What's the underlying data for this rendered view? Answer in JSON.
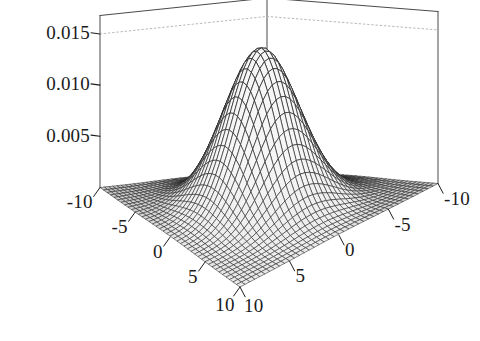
{
  "figure": {
    "kind": "surface-plot-3d",
    "background_color": "#ffffff",
    "line_color": "#1d1d1d",
    "box_color": "#4a4a4a",
    "grid_color": "#b8b8b8",
    "title": "",
    "subtitle": ""
  },
  "axes": {
    "z": {
      "label": "",
      "ticks": [
        "0.015",
        "0.010",
        "0.005"
      ],
      "tick_values": [
        0.015,
        0.01,
        0.005
      ],
      "range": [
        0,
        0.0168
      ]
    },
    "x": {
      "label": "",
      "ticks": [
        "-10",
        "-5",
        "0",
        "5",
        "10"
      ],
      "tick_values": [
        -10,
        -5,
        0,
        5,
        10
      ],
      "range": [
        -10,
        10
      ]
    },
    "y": {
      "label": "",
      "ticks": [
        "-10",
        "-5",
        "0",
        "5",
        "10"
      ],
      "tick_values": [
        -10,
        -5,
        0,
        5,
        10
      ],
      "range": [
        -10,
        10
      ]
    }
  },
  "chart_data": {
    "type": "surface",
    "title": "",
    "xlabel": "",
    "ylabel": "",
    "zlabel": "",
    "xlim": [
      -10,
      10
    ],
    "ylim": [
      -10,
      10
    ],
    "zlim": [
      0,
      0.0168
    ],
    "grid": true,
    "legend": false,
    "legend_position": "none",
    "xticks": [
      -10,
      -5,
      0,
      5,
      10
    ],
    "yticks": [
      -10,
      -5,
      0,
      5,
      10
    ],
    "zticks": [
      0.005,
      0.01,
      0.015
    ],
    "xtick_labels": [
      "-10",
      "-5",
      "0",
      "5",
      "10"
    ],
    "ytick_labels": [
      "-10",
      "-5",
      "0",
      "5",
      "10"
    ],
    "ztick_labels": [
      "0.005",
      "0.010",
      "0.015"
    ],
    "function": "bivariate gaussian: z = 1/(2*pi*sigma^2) * exp(-(x^2+y^2)/(2*sigma^2))",
    "sigma": 3.2,
    "peak_value": 0.01554,
    "peak_location": [
      0,
      0
    ],
    "mesh_rows": 41,
    "mesh_cols": 41,
    "surface_fill": "#f2f2f2",
    "mesh_line_color": "#262626",
    "z_series_note": "values sampled on a 41x41 grid over x in [-10,10], y in [-10,10]",
    "sample_points": [
      {
        "x": 0,
        "y": 0,
        "z": 0.01554
      },
      {
        "x": 0,
        "y": 3.2,
        "z": 0.00943
      },
      {
        "x": 3.2,
        "y": 0,
        "z": 0.00943
      },
      {
        "x": 3.2,
        "y": 3.2,
        "z": 0.00572
      },
      {
        "x": 0,
        "y": 6.4,
        "z": 0.0021
      },
      {
        "x": 6.4,
        "y": 0,
        "z": 0.0021
      },
      {
        "x": 5,
        "y": 5,
        "z": 0.00328
      },
      {
        "x": 10,
        "y": 0,
        "z": 0.000124
      },
      {
        "x": 0,
        "y": 10,
        "z": 0.000124
      },
      {
        "x": -10,
        "y": -10,
        "z": 9.9e-07
      },
      {
        "x": 10,
        "y": 10,
        "z": 9.9e-07
      },
      {
        "x": -10,
        "y": 10,
        "z": 9.9e-07
      },
      {
        "x": 10,
        "y": -10,
        "z": 9.9e-07
      }
    ]
  },
  "tick_labels": {
    "z0": "0.015",
    "z1": "0.010",
    "z2": "0.005",
    "x0": "-10",
    "x1": "-5",
    "x2": "0",
    "x3": "5",
    "x4": "10",
    "y0": "-10",
    "y1": "-5",
    "y2": "0",
    "y3": "5",
    "y4": "10"
  }
}
